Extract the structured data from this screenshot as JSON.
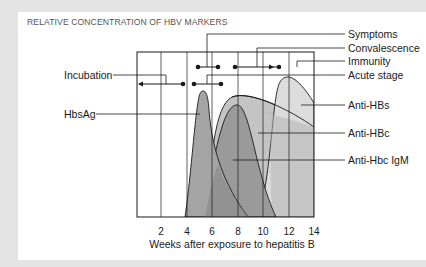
{
  "title": "RELATIVE CONCENTRATION OF HBV MARKERS",
  "labels": {
    "symptoms": "Symptoms",
    "convalescence": "Convalescence",
    "immunity": "Immunity",
    "acute_stage": "Acute stage",
    "incubation": "Incubation",
    "hbsag": "HbsAg",
    "anti_hbs": "Anti-HBs",
    "anti_hbc": "Anti-HBc",
    "anti_hbc_igm": "Anti-Hbc IgM"
  },
  "x_axis": {
    "label": "Weeks after exposure to hepatitis B",
    "ticks": [
      "2",
      "4",
      "6",
      "8",
      "10",
      "12",
      "14"
    ]
  },
  "colors": {
    "background": "#e4e4e4",
    "card": "#ffffff",
    "hbsag_fill": "#a6a6a6",
    "anti_hbc_fill": "#c8c8c8",
    "anti_hbc_igm_fill": "#9d9d9d",
    "anti_hbs_fill": "#dedede",
    "line": "#1a1a1a"
  }
}
